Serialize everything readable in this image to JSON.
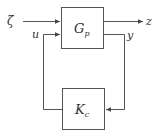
{
  "diagram": {
    "type": "feedback-block-diagram",
    "blocks": [
      {
        "id": "plant",
        "label": "G",
        "subscript": "p"
      },
      {
        "id": "controller",
        "label": "K",
        "subscript": "c"
      }
    ],
    "signals": {
      "exogenous_input": "ζ",
      "control_input": "u",
      "performance_output": "z",
      "measured_output": "y"
    },
    "colors": {
      "line": "#555555",
      "text": "#333333",
      "background": "#ffffff"
    }
  }
}
